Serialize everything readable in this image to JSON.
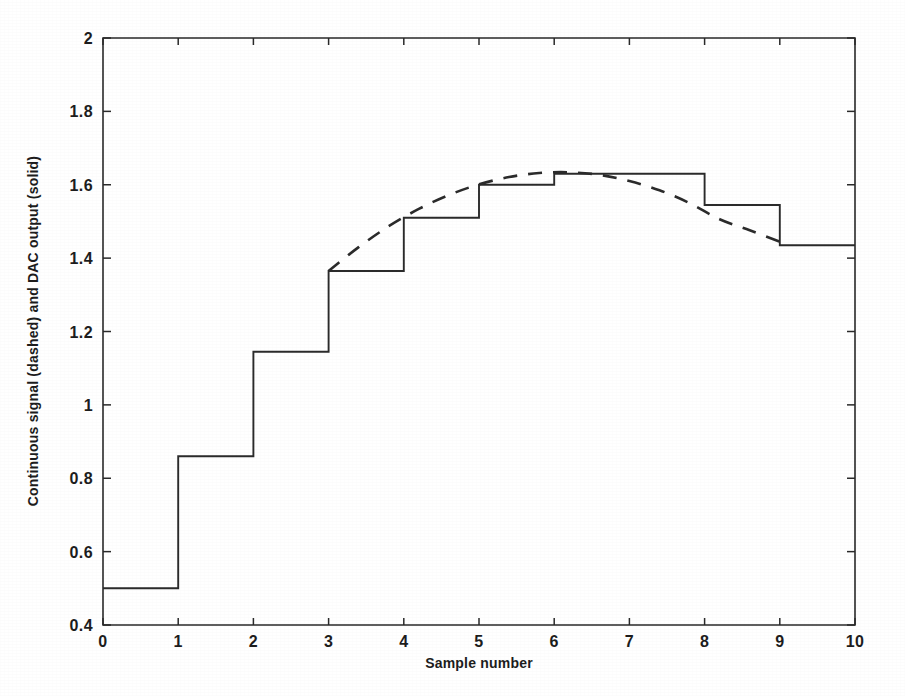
{
  "figure": {
    "background_color": "#ffffff",
    "ink_color": "#2b2b2b"
  },
  "chart_data": {
    "type": "line",
    "title": "",
    "subtitle": "",
    "xlabel": "Sample number",
    "ylabel": "Continuous signal (dashed) and DAC output (solid)",
    "xlim": [
      0,
      10
    ],
    "ylim": [
      0.4,
      2
    ],
    "xticks": [
      0,
      1,
      2,
      3,
      4,
      5,
      6,
      7,
      8,
      9,
      10
    ],
    "xticklabels": [
      "0",
      "1",
      "2",
      "3",
      "4",
      "5",
      "6",
      "7",
      "8",
      "9",
      "10"
    ],
    "yticks": [
      0.4,
      0.6,
      0.8,
      1,
      1.2,
      1.4,
      1.6,
      1.8,
      2
    ],
    "yticklabels": [
      "0.4",
      "0.6",
      "0.8",
      "1",
      "1.2",
      "1.4",
      "1.6",
      "1.8",
      "2"
    ],
    "grid": false,
    "legend": "none",
    "legend_position": "none",
    "series": [
      {
        "name": "DAC output (solid)",
        "style": "solid-staircase",
        "drawstyle": "steps-post",
        "x": [
          0,
          1,
          2,
          3,
          4,
          5,
          6,
          7,
          8,
          9,
          10
        ],
        "values": [
          0.5,
          0.86,
          1.145,
          1.365,
          1.51,
          1.6,
          1.63,
          1.63,
          1.545,
          1.435,
          1.435
        ]
      },
      {
        "name": "Continuous signal (dashed)",
        "style": "dashed-curve",
        "x": [
          3.0,
          3.4,
          3.8,
          4.2,
          4.6,
          5.0,
          5.4,
          5.8,
          6.2,
          6.6,
          7.0,
          7.4,
          7.8,
          8.2,
          8.6,
          9.0
        ],
        "values": [
          1.365,
          1.43,
          1.487,
          1.534,
          1.572,
          1.601,
          1.621,
          1.632,
          1.634,
          1.627,
          1.61,
          1.585,
          1.55,
          1.506,
          1.476,
          1.445
        ]
      }
    ]
  },
  "annotations": {
    "axis_frame": "box",
    "tick_direction": "in"
  }
}
